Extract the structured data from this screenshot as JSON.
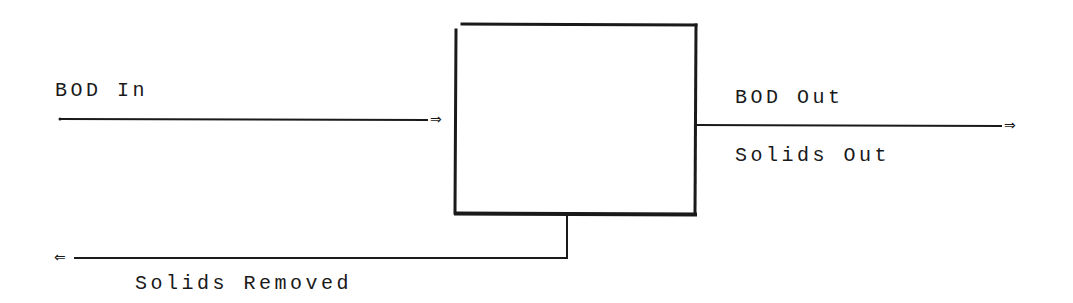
{
  "diagram": {
    "type": "process-flow",
    "process_box": {
      "label": "",
      "x": 456,
      "y": 23,
      "width": 240,
      "height": 192
    },
    "flows": [
      {
        "id": "bod-in",
        "label": "BOD In",
        "direction": "into-box",
        "arrow": "⇒",
        "from": [
          59,
          119
        ],
        "to": [
          430,
          119
        ]
      },
      {
        "id": "bod-out",
        "label": "BOD Out",
        "direction": "out-of-box",
        "arrow": "⇒",
        "from": [
          696,
          125
        ],
        "to": [
          1003,
          125
        ]
      },
      {
        "id": "solids-out",
        "label": "Solids Out",
        "direction": "out-of-box",
        "shares_line_with": "bod-out"
      },
      {
        "id": "solids-removed",
        "label": "Solids Removed",
        "direction": "out-of-box",
        "arrow": "⇐",
        "from": [
          567,
          215
        ],
        "via": [
          567,
          258
        ],
        "to": [
          73,
          258
        ]
      }
    ],
    "colors": {
      "ink": "#1a1a1a",
      "background": "#ffffff"
    }
  }
}
